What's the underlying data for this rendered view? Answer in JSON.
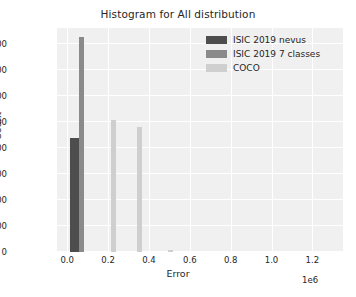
{
  "chart_data": {
    "type": "bar",
    "title": "Histogram for All distribution",
    "xlabel": "Error",
    "ylabel": "Count",
    "x_offset_text": "1e6",
    "xlim": [
      -0.05,
      1.35
    ],
    "ylim": [
      0,
      4300
    ],
    "grid": true,
    "legend_position": "upper right",
    "xticks": [
      "0.0",
      "0.2",
      "0.4",
      "0.6",
      "0.8",
      "1.0",
      "1.2"
    ],
    "xtick_values": [
      0.0,
      0.2,
      0.4,
      0.6,
      0.8,
      1.0,
      1.2
    ],
    "yticks": [
      "0",
      "500",
      "1000",
      "1500",
      "2000",
      "2500",
      "3000",
      "3500",
      "4000"
    ],
    "ytick_values": [
      0,
      500,
      1000,
      1500,
      2000,
      2500,
      3000,
      3500,
      4000
    ],
    "series": [
      {
        "name": "ISIC 2019 nevus",
        "color": "#4d4d4d",
        "bars": [
          {
            "x": 0.012,
            "width": 0.048,
            "value": 2180
          }
        ]
      },
      {
        "name": "ISIC 2019 7 classes",
        "color": "#8a8a8a",
        "bars": [
          {
            "x": 0.058,
            "width": 0.026,
            "value": 4130
          }
        ]
      },
      {
        "name": "COCO",
        "color": "#cfcfcf",
        "bars": [
          {
            "x": 0.212,
            "width": 0.026,
            "value": 2540
          },
          {
            "x": 0.342,
            "width": 0.026,
            "value": 2400
          },
          {
            "x": 0.492,
            "width": 0.026,
            "value": 40
          }
        ]
      }
    ]
  },
  "legend": {
    "items": [
      {
        "label": "ISIC 2019 nevus",
        "color": "#4d4d4d"
      },
      {
        "label": "ISIC 2019 7 classes",
        "color": "#8a8a8a"
      },
      {
        "label": "COCO",
        "color": "#cfcfcf"
      }
    ]
  }
}
